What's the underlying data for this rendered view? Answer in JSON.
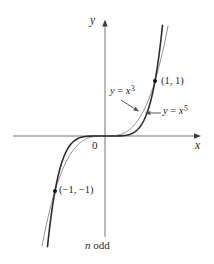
{
  "chart_data": {
    "type": "line",
    "title": "",
    "xlabel": "x",
    "ylabel": "y",
    "annotation": "n odd",
    "axes": {
      "x_visible_range": [
        -1.85,
        2.0
      ],
      "y_visible_range": [
        -1.95,
        2.1
      ],
      "ticks": [],
      "grid": false,
      "origin_label": "0"
    },
    "series": [
      {
        "name": "y = x^3",
        "exponent": 3,
        "x_domain": [
          -1.26,
          1.26
        ],
        "label": {
          "lhs": "y",
          "eq": " = ",
          "base": "x",
          "exp": "3"
        },
        "color": "#8f8f8f",
        "width": 1
      },
      {
        "name": "y = x^5",
        "exponent": 5,
        "x_domain": [
          -1.15,
          1.15
        ],
        "label": {
          "lhs": "y",
          "eq": " = ",
          "base": "x",
          "exp": "5"
        },
        "color": "#2e2e2e",
        "width": 1.6
      }
    ],
    "marked_points": [
      {
        "x": 1,
        "y": 1,
        "label": "(1, 1)"
      },
      {
        "x": -1,
        "y": -1,
        "label": "(−1, −1)"
      }
    ]
  },
  "figure": {
    "origin_label": "0",
    "x_axis_label": "x",
    "y_axis_label": "y",
    "caption_var": "n",
    "caption_rest": " odd",
    "colors": {
      "background": "#ffffff",
      "axis": "#757575",
      "arrowhead": "#3c3c3c",
      "callout": "#4a4a4a",
      "curve_x3": "#8f8f8f",
      "curve_x5": "#2e2e2e",
      "text": "#1f1f1f",
      "point": "#111111"
    }
  }
}
